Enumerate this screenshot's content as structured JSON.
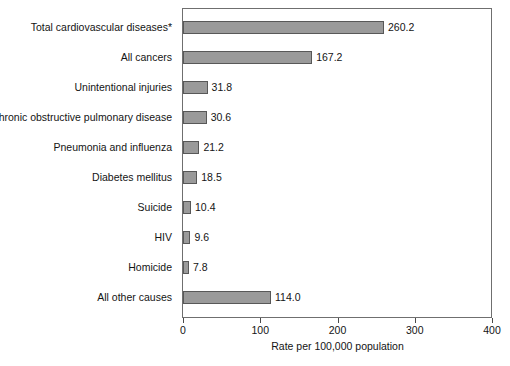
{
  "chart_data": {
    "type": "bar",
    "orientation": "horizontal",
    "title": "",
    "xlabel": "Rate per 100,000 population",
    "ylabel": "",
    "xlim": [
      0,
      400
    ],
    "xticks": [
      0,
      100,
      200,
      300,
      400
    ],
    "xtick_labels": [
      "0",
      "100",
      "200",
      "300",
      "400"
    ],
    "grid": false,
    "legend": null,
    "bar_color": "#9a9a9a",
    "bar_border_color": "#585858",
    "categories": [
      "Total cardiovascular diseases*",
      "All cancers",
      "Unintentional injuries",
      "Chronic obstructive pulmonary disease",
      "Pneumonia and influenza",
      "Diabetes mellitus",
      "Suicide",
      "HIV",
      "Homicide",
      "All other causes"
    ],
    "values": [
      260.2,
      167.2,
      31.8,
      30.6,
      21.2,
      18.5,
      10.4,
      9.6,
      7.8,
      114.0
    ],
    "value_labels": [
      "260.2",
      "167.2",
      "31.8",
      "30.6",
      "21.2",
      "18.5",
      "10.4",
      "9.6",
      "7.8",
      "114.0"
    ]
  }
}
